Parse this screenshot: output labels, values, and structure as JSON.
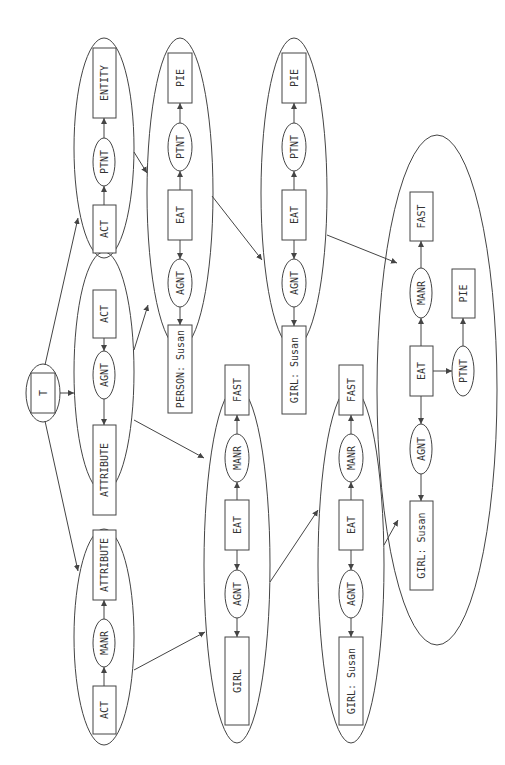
{
  "diagram": {
    "orientation": "rotated-90-ccw",
    "colors": {
      "stroke": "#444444",
      "text": "#333333",
      "background": "#ffffff"
    },
    "root": {
      "id": "T",
      "label": "T",
      "cx": 43,
      "cy": 393,
      "rx": 17,
      "ry": 29
    },
    "contexts": [
      {
        "id": "A",
        "cx": 104,
        "cy": 148,
        "rx": 30,
        "ry": 110,
        "nodes": [
          {
            "id": "A1",
            "type": "concept",
            "label": "ENTITY",
            "x": 93,
            "y": 48,
            "w": 23,
            "h": 70
          },
          {
            "id": "A2",
            "type": "relation",
            "label": "PTNT",
            "cx": 104,
            "cy": 162,
            "rx": 11,
            "ry": 24
          },
          {
            "id": "A3",
            "type": "concept",
            "label": "ACT",
            "x": 93,
            "y": 205,
            "w": 23,
            "h": 48
          }
        ]
      },
      {
        "id": "B",
        "cx": 104,
        "cy": 372,
        "rx": 30,
        "ry": 120,
        "nodes": [
          {
            "id": "B1",
            "type": "concept",
            "label": "ACT",
            "x": 93,
            "y": 290,
            "w": 23,
            "h": 48
          },
          {
            "id": "B2",
            "type": "relation",
            "label": "AGNT",
            "cx": 104,
            "cy": 375,
            "rx": 11,
            "ry": 24
          },
          {
            "id": "B3",
            "type": "concept",
            "label": "ATTRIBUTE",
            "x": 93,
            "y": 425,
            "w": 23,
            "h": 90
          }
        ]
      },
      {
        "id": "C",
        "cx": 104,
        "cy": 637,
        "rx": 30,
        "ry": 108,
        "nodes": [
          {
            "id": "C1",
            "type": "concept",
            "label": "ATTRIBUTE",
            "x": 93,
            "y": 530,
            "w": 23,
            "h": 70
          },
          {
            "id": "C2",
            "type": "relation",
            "label": "MANR",
            "cx": 104,
            "cy": 643,
            "rx": 11,
            "ry": 24
          },
          {
            "id": "C3",
            "type": "concept",
            "label": "ACT",
            "x": 93,
            "y": 686,
            "w": 23,
            "h": 48
          }
        ]
      },
      {
        "id": "D",
        "cx": 180,
        "cy": 193,
        "rx": 33,
        "ry": 155,
        "nodes": [
          {
            "id": "D1",
            "type": "concept",
            "label": "PIE",
            "x": 168,
            "y": 53,
            "w": 24,
            "h": 50
          },
          {
            "id": "D2",
            "type": "relation",
            "label": "PTNT",
            "cx": 180,
            "cy": 147,
            "rx": 12,
            "ry": 24
          },
          {
            "id": "D3",
            "type": "concept",
            "label": "EAT",
            "x": 168,
            "y": 190,
            "w": 24,
            "h": 50
          },
          {
            "id": "D4",
            "type": "relation",
            "label": "AGNT",
            "cx": 180,
            "cy": 283,
            "rx": 12,
            "ry": 24
          },
          {
            "id": "D5",
            "type": "concept",
            "label": "PERSON: Susan",
            "x": 168,
            "y": 325,
            "w": 24,
            "h": 88
          }
        ]
      },
      {
        "id": "E",
        "cx": 237,
        "cy": 565,
        "rx": 33,
        "ry": 178,
        "nodes": [
          {
            "id": "E1",
            "type": "concept",
            "label": "FAST",
            "x": 225,
            "y": 365,
            "w": 24,
            "h": 50
          },
          {
            "id": "E2",
            "type": "relation",
            "label": "MANR",
            "cx": 237,
            "cy": 458,
            "rx": 12,
            "ry": 24
          },
          {
            "id": "E3",
            "type": "concept",
            "label": "EAT",
            "x": 225,
            "y": 500,
            "w": 24,
            "h": 50
          },
          {
            "id": "E4",
            "type": "relation",
            "label": "AGNT",
            "cx": 237,
            "cy": 594,
            "rx": 12,
            "ry": 24
          },
          {
            "id": "E5",
            "type": "concept",
            "label": "GIRL",
            "x": 225,
            "y": 637,
            "w": 24,
            "h": 88
          }
        ]
      },
      {
        "id": "F",
        "cx": 294,
        "cy": 193,
        "rx": 33,
        "ry": 155,
        "nodes": [
          {
            "id": "F1",
            "type": "concept",
            "label": "PIE",
            "x": 282,
            "y": 53,
            "w": 24,
            "h": 50
          },
          {
            "id": "F2",
            "type": "relation",
            "label": "PTNT",
            "cx": 294,
            "cy": 147,
            "rx": 12,
            "ry": 24
          },
          {
            "id": "F3",
            "type": "concept",
            "label": "EAT",
            "x": 282,
            "y": 190,
            "w": 24,
            "h": 50
          },
          {
            "id": "F4",
            "type": "relation",
            "label": "AGNT",
            "cx": 294,
            "cy": 283,
            "rx": 12,
            "ry": 24
          },
          {
            "id": "F5",
            "type": "concept",
            "label": "GIRL: Susan",
            "x": 282,
            "y": 326,
            "w": 24,
            "h": 88
          }
        ]
      },
      {
        "id": "G",
        "cx": 351,
        "cy": 565,
        "rx": 33,
        "ry": 178,
        "nodes": [
          {
            "id": "G1",
            "type": "concept",
            "label": "FAST",
            "x": 339,
            "y": 365,
            "w": 24,
            "h": 50
          },
          {
            "id": "G2",
            "type": "relation",
            "label": "MANR",
            "cx": 351,
            "cy": 458,
            "rx": 12,
            "ry": 24
          },
          {
            "id": "G3",
            "type": "concept",
            "label": "EAT",
            "x": 339,
            "y": 500,
            "w": 24,
            "h": 50
          },
          {
            "id": "G4",
            "type": "relation",
            "label": "AGNT",
            "cx": 351,
            "cy": 594,
            "rx": 12,
            "ry": 24
          },
          {
            "id": "G5",
            "type": "concept",
            "label": "GIRL: Susan",
            "x": 339,
            "y": 637,
            "w": 24,
            "h": 88
          }
        ]
      },
      {
        "id": "H",
        "cx": 437,
        "cy": 390,
        "rx": 60,
        "ry": 255,
        "nodes": [
          {
            "id": "H1",
            "type": "concept",
            "label": "FAST",
            "x": 410,
            "y": 192,
            "w": 23,
            "h": 49
          },
          {
            "id": "H2",
            "type": "relation",
            "label": "MANR",
            "cx": 421,
            "cy": 293,
            "rx": 11,
            "ry": 25
          },
          {
            "id": "H3",
            "type": "concept",
            "label": "EAT",
            "x": 410,
            "y": 346,
            "w": 23,
            "h": 50
          },
          {
            "id": "H4",
            "type": "relation",
            "label": "PTNT",
            "cx": 463,
            "cy": 371,
            "rx": 11,
            "ry": 25
          },
          {
            "id": "H5",
            "type": "concept",
            "label": "PIE",
            "x": 452,
            "y": 269,
            "w": 23,
            "h": 49
          },
          {
            "id": "H6",
            "type": "relation",
            "label": "AGNT",
            "cx": 421,
            "cy": 449,
            "rx": 11,
            "ry": 25
          },
          {
            "id": "H7",
            "type": "concept",
            "label": "GIRL: Susan",
            "x": 410,
            "y": 501,
            "w": 23,
            "h": 89
          }
        ]
      }
    ],
    "inner_edges": [
      {
        "from": "A3",
        "to": "A2",
        "x1": 104,
        "y1": 205,
        "x2": 104,
        "y2": 186
      },
      {
        "from": "A2",
        "to": "A1",
        "x1": 104,
        "y1": 138,
        "x2": 104,
        "y2": 118
      },
      {
        "from": "B1",
        "to": "B2",
        "x1": 104,
        "y1": 338,
        "x2": 104,
        "y2": 351
      },
      {
        "from": "B2",
        "to": "B3",
        "x1": 104,
        "y1": 399,
        "x2": 104,
        "y2": 425
      },
      {
        "from": "C3",
        "to": "C2",
        "x1": 104,
        "y1": 686,
        "x2": 104,
        "y2": 667
      },
      {
        "from": "C2",
        "to": "C1",
        "x1": 104,
        "y1": 619,
        "x2": 104,
        "y2": 600
      },
      {
        "from": "D3",
        "to": "D2",
        "x1": 180,
        "y1": 190,
        "x2": 180,
        "y2": 171
      },
      {
        "from": "D2",
        "to": "D1",
        "x1": 180,
        "y1": 123,
        "x2": 180,
        "y2": 103
      },
      {
        "from": "D3",
        "to": "D4",
        "x1": 180,
        "y1": 240,
        "x2": 180,
        "y2": 259
      },
      {
        "from": "D4",
        "to": "D5",
        "x1": 180,
        "y1": 307,
        "x2": 180,
        "y2": 325
      },
      {
        "from": "E3",
        "to": "E2",
        "x1": 237,
        "y1": 500,
        "x2": 237,
        "y2": 482
      },
      {
        "from": "E2",
        "to": "E1",
        "x1": 237,
        "y1": 434,
        "x2": 237,
        "y2": 415
      },
      {
        "from": "E3",
        "to": "E4",
        "x1": 237,
        "y1": 550,
        "x2": 237,
        "y2": 570
      },
      {
        "from": "E4",
        "to": "E5",
        "x1": 237,
        "y1": 618,
        "x2": 237,
        "y2": 637
      },
      {
        "from": "F3",
        "to": "F2",
        "x1": 294,
        "y1": 190,
        "x2": 294,
        "y2": 171
      },
      {
        "from": "F2",
        "to": "F1",
        "x1": 294,
        "y1": 123,
        "x2": 294,
        "y2": 103
      },
      {
        "from": "F3",
        "to": "F4",
        "x1": 294,
        "y1": 240,
        "x2": 294,
        "y2": 259
      },
      {
        "from": "F4",
        "to": "F5",
        "x1": 294,
        "y1": 307,
        "x2": 294,
        "y2": 326
      },
      {
        "from": "G3",
        "to": "G2",
        "x1": 351,
        "y1": 500,
        "x2": 351,
        "y2": 482
      },
      {
        "from": "G2",
        "to": "G1",
        "x1": 351,
        "y1": 434,
        "x2": 351,
        "y2": 415
      },
      {
        "from": "G3",
        "to": "G4",
        "x1": 351,
        "y1": 550,
        "x2": 351,
        "y2": 570
      },
      {
        "from": "G4",
        "to": "G5",
        "x1": 351,
        "y1": 618,
        "x2": 351,
        "y2": 637
      },
      {
        "from": "H3",
        "to": "H2",
        "x1": 421,
        "y1": 346,
        "x2": 421,
        "y2": 318
      },
      {
        "from": "H2",
        "to": "H1",
        "x1": 421,
        "y1": 268,
        "x2": 421,
        "y2": 241
      },
      {
        "from": "H3",
        "to": "H4",
        "x1": 433,
        "y1": 371,
        "x2": 452,
        "y2": 371
      },
      {
        "from": "H4",
        "to": "H5",
        "x1": 463,
        "y1": 346,
        "x2": 463,
        "y2": 318
      },
      {
        "from": "H3",
        "to": "H6",
        "x1": 421,
        "y1": 396,
        "x2": 421,
        "y2": 424
      },
      {
        "from": "H6",
        "to": "H7",
        "x1": 421,
        "y1": 474,
        "x2": 421,
        "y2": 501
      }
    ],
    "outer_edges": [
      {
        "from": "T",
        "to": "A",
        "x1": 45,
        "y1": 365,
        "x2": 78,
        "y2": 218
      },
      {
        "from": "T",
        "to": "B",
        "x1": 60,
        "y1": 393,
        "x2": 74,
        "y2": 393
      },
      {
        "from": "T",
        "to": "C",
        "x1": 45,
        "y1": 421,
        "x2": 78,
        "y2": 571
      },
      {
        "from": "A",
        "to": "D",
        "x1": 134,
        "y1": 152,
        "x2": 147,
        "y2": 173
      },
      {
        "from": "B",
        "to": "D",
        "x1": 134,
        "y1": 350,
        "x2": 148,
        "y2": 305
      },
      {
        "from": "B",
        "to": "E",
        "x1": 134,
        "y1": 420,
        "x2": 204,
        "y2": 458
      },
      {
        "from": "C",
        "to": "E",
        "x1": 134,
        "y1": 670,
        "x2": 205,
        "y2": 632
      },
      {
        "from": "D",
        "to": "F",
        "x1": 212,
        "y1": 196,
        "x2": 262,
        "y2": 260
      },
      {
        "from": "E",
        "to": "G",
        "x1": 270,
        "y1": 582,
        "x2": 318,
        "y2": 510
      },
      {
        "from": "F",
        "to": "H",
        "x1": 327,
        "y1": 235,
        "x2": 397,
        "y2": 263
      },
      {
        "from": "G",
        "to": "H",
        "x1": 384,
        "y1": 545,
        "x2": 398,
        "y2": 520
      }
    ]
  }
}
